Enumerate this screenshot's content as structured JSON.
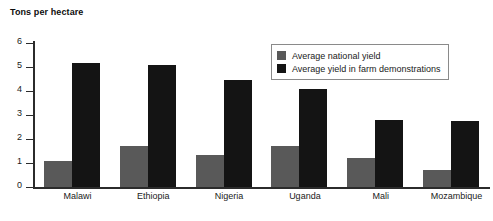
{
  "chart_data": {
    "type": "bar",
    "title": "",
    "xlabel": "",
    "ylabel": "Tons per hectare",
    "ylim": [
      0,
      6
    ],
    "yticks": [
      0,
      1,
      2,
      3,
      4,
      5,
      6
    ],
    "grid": false,
    "legend_position": "top-right",
    "categories": [
      "Malawi",
      "Ethiopia",
      "Nigeria",
      "Uganda",
      "Mali",
      "Mozambique"
    ],
    "series": [
      {
        "name": "Average national yield",
        "color": "#595959",
        "values": [
          1.1,
          1.7,
          1.35,
          1.7,
          1.2,
          0.7
        ]
      },
      {
        "name": "Average yield in farm demonstrations",
        "color": "#141414",
        "values": [
          5.15,
          5.1,
          4.45,
          4.1,
          2.8,
          2.75
        ]
      }
    ]
  },
  "axis": {
    "y_title": "Tons per hectare",
    "tick_labels": [
      "6",
      "5",
      "4",
      "3",
      "2",
      "1",
      "0"
    ]
  },
  "legend": {
    "items": [
      {
        "label": "Average national yield",
        "color": "#595959"
      },
      {
        "label": "Average yield in farm demonstrations",
        "color": "#141414"
      }
    ]
  }
}
